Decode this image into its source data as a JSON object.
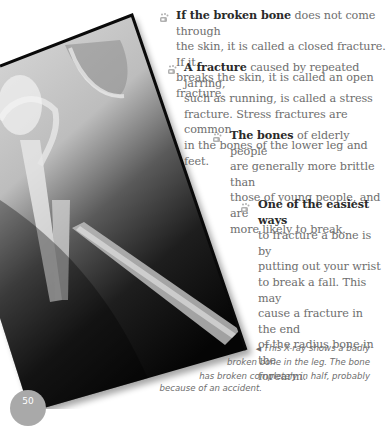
{
  "page": {
    "number": "50",
    "accent_color": "#a9a9a9",
    "text_color": "#6e6e6e",
    "bold_color": "#2a2a2a"
  },
  "figure": {
    "name": "xray-broken-leg",
    "caption_arrow": "◀",
    "caption_lines": [
      "This X-ray shows a badly",
      "broken bone in the leg. The bone",
      "has broken completely in half, probably",
      "because of an accident."
    ]
  },
  "facts": [
    {
      "icon": "bone-paw-bullet-icon",
      "lead": "If the broken bone",
      "lines": [
        " does not come through",
        "the skin, it is called a closed fracture. If it",
        "breaks the skin, it is called an open fracture."
      ]
    },
    {
      "icon": "bone-paw-bullet-icon",
      "lead": "A fracture",
      "lines": [
        " caused by repeated jarring,",
        "such as running, is called a stress",
        "fracture. Stress fractures are common",
        "in the bones of the lower leg and feet."
      ]
    },
    {
      "icon": "bone-paw-bullet-icon",
      "lead": "The bones",
      "lines": [
        " of elderly people",
        "are generally more brittle than",
        "those of young people, and are",
        "more likely to break."
      ]
    },
    {
      "icon": "bone-paw-bullet-icon",
      "lead": "One of the easiest ways",
      "lines": [
        "",
        "to fracture a bone is by",
        "putting out your wrist",
        "to break a fall. This may",
        "cause a fracture in the end",
        "of the radius bone in the",
        "forearm."
      ]
    }
  ]
}
